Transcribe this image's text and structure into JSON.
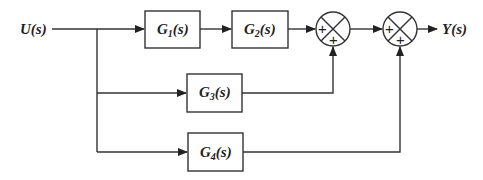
{
  "diagram": {
    "type": "block-diagram",
    "input": {
      "label": "U(s)"
    },
    "output": {
      "label": "Y(s)"
    },
    "blocks": [
      {
        "id": "G1",
        "main": "G",
        "sub": "1",
        "tail": "(s)"
      },
      {
        "id": "G2",
        "main": "G",
        "sub": "2",
        "tail": "(s)"
      },
      {
        "id": "G3",
        "main": "G",
        "sub": "3",
        "tail": "(s)"
      },
      {
        "id": "G4",
        "main": "G",
        "sub": "4",
        "tail": "(s)"
      }
    ],
    "summing_junctions": [
      {
        "id": "S1",
        "signs": [
          "+",
          "+"
        ],
        "inputs": [
          "G2",
          "G3"
        ]
      },
      {
        "id": "S2",
        "signs": [
          "+",
          "+"
        ],
        "inputs": [
          "S1",
          "G4"
        ]
      }
    ],
    "connections": [
      "U(s) -> G1",
      "G1 -> G2",
      "G2 -> S1",
      "U(s) -> G3",
      "G3 -> S1",
      "S1 -> S2",
      "U(s) -> G4",
      "G4 -> S2",
      "S2 -> Y(s)"
    ]
  }
}
